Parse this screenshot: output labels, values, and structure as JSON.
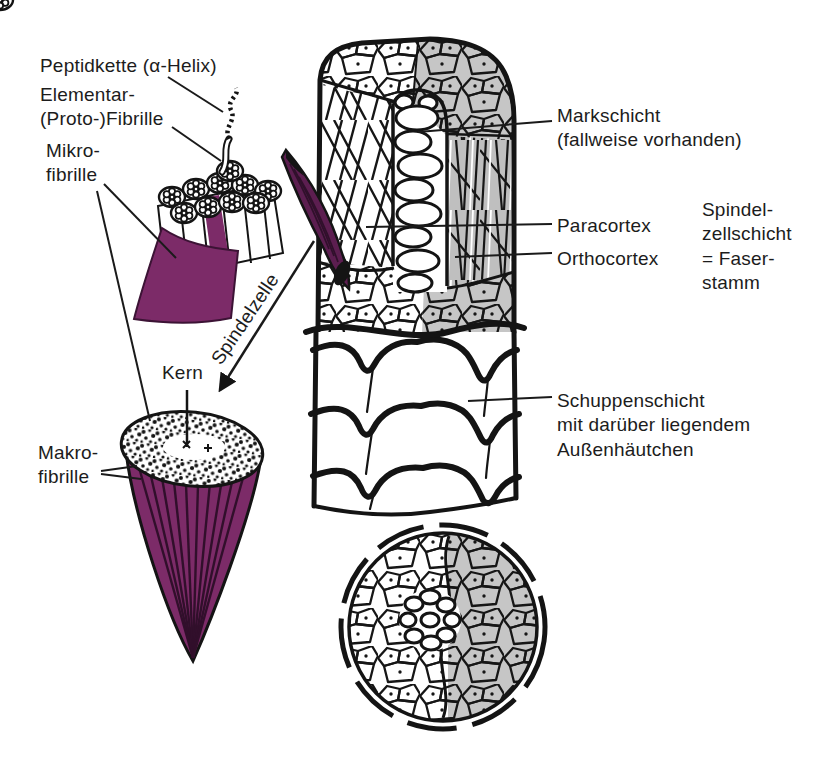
{
  "figure": {
    "colors": {
      "purple": "#7c2b68",
      "purple_dark": "#5c1e50",
      "gray_shade": "#c6c6c6",
      "ink": "#161616",
      "background": "#ffffff"
    },
    "labels": {
      "peptidkette": "Peptidkette (α-Helix)",
      "elementar_fibrille": "Elementar-\n(Proto-)Fibrille",
      "mikro_fibrille": "Mikro-\nfibrille",
      "spindelzelle": "Spindelzelle",
      "kern": "Kern",
      "makro_fibrille": "Makro-\nfibrille",
      "markschicht": "Markschicht\n(fallweise vorhanden)",
      "paracortex": "Paracortex",
      "orthocortex": "Orthocortex",
      "spindelzellschicht": "Spindel-\nzellschicht\n= Faser-\nstamm",
      "schuppenschicht": "Schuppenschicht\nmit darüber liegendem\nAußenhäutchen"
    }
  }
}
